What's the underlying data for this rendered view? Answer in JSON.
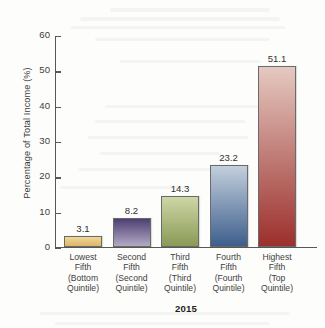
{
  "chart_data": {
    "type": "bar",
    "title": "",
    "xlabel": "2015",
    "ylabel": "Percentage of Total Income (%)",
    "ylim": [
      0,
      60
    ],
    "yticks": [
      0,
      10,
      20,
      30,
      40,
      50,
      60
    ],
    "grid": false,
    "legend": "none",
    "categories": [
      "Lowest Fifth (Bottom Quintile)",
      "Second Fifth (Second Quintile)",
      "Third Fifth (Third Quintile)",
      "Fourth Fifth (Fourth Quintile)",
      "Highest Fifth (Top Quintile)"
    ],
    "category_lines": [
      [
        "Lowest",
        "Fifth",
        "(Bottom",
        "Quintile)"
      ],
      [
        "Second",
        "Fifth",
        "(Second",
        "Quintile)"
      ],
      [
        "Third",
        "Fifth",
        "(Third",
        "Quintile)"
      ],
      [
        "Fourth",
        "Fifth",
        "(Fourth",
        "Quintile)"
      ],
      [
        "Highest",
        "Fifth",
        "(Top",
        "Quintile)"
      ]
    ],
    "values": [
      3.1,
      8.2,
      14.3,
      23.2,
      51.1
    ],
    "value_labels": [
      "3.1",
      "8.2",
      "14.3",
      "23.2",
      "51.1"
    ],
    "bar_colors_top": [
      "#f0d79a",
      "#4e3f72",
      "#cdd6a6",
      "#c3cfdd",
      "#e4c9c0"
    ],
    "bar_colors_bottom": [
      "#dcb765",
      "#b3aac6",
      "#8a9a56",
      "#3d5e8c",
      "#9c2f2c"
    ],
    "axis_color": "#585858",
    "text_color": "#3d3d3d"
  }
}
